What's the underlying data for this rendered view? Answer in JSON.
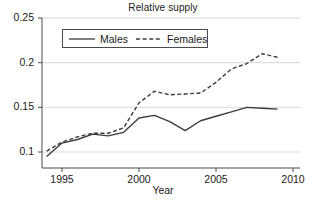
{
  "chart_data": {
    "type": "line",
    "title": "Relative supply",
    "xlabel": "Year",
    "ylabel": "",
    "xlim": [
      1993.6,
      2010.4
    ],
    "ylim": [
      0.0845,
      0.2555
    ],
    "xticks": [
      1995,
      2000,
      2005,
      2010
    ],
    "xtick_labels": [
      "1995",
      "2000",
      "2005",
      "2010"
    ],
    "yticks": [
      0.1,
      0.15,
      0.2,
      0.25
    ],
    "ytick_labels": [
      "0.1",
      "0.15",
      "0.2",
      "0.25"
    ],
    "grid": "horizontal",
    "legend_position": "upper-left-inside",
    "x": [
      1994,
      1995,
      1996,
      1997,
      1998,
      1999,
      2000,
      2001,
      2002,
      2003,
      2004,
      2005,
      2006,
      2007,
      2008,
      2009
    ],
    "series": [
      {
        "name": "Males",
        "style": "solid",
        "color": "#3c3c3c",
        "values": [
          0.095,
          0.11,
          0.114,
          0.12,
          0.118,
          0.122,
          0.138,
          0.141,
          0.134,
          0.124,
          0.135,
          0.14,
          0.145,
          0.15,
          0.149,
          0.148
        ]
      },
      {
        "name": "Females",
        "style": "dashed",
        "color": "#3c3c3c",
        "values": [
          0.101,
          0.111,
          0.117,
          0.121,
          0.121,
          0.127,
          0.155,
          0.168,
          0.164,
          0.165,
          0.166,
          0.178,
          0.193,
          0.199,
          0.21,
          0.206
        ]
      }
    ]
  },
  "legend": {
    "entries": [
      {
        "label": "Males",
        "icon": "solid-line-icon"
      },
      {
        "label": "Females",
        "icon": "dashed-line-icon"
      }
    ]
  },
  "style": {
    "axis_color": "#4a4a4a",
    "grid_color": "#d8d8d8",
    "text_color": "#1a1a1a",
    "background": "#ffffff"
  }
}
